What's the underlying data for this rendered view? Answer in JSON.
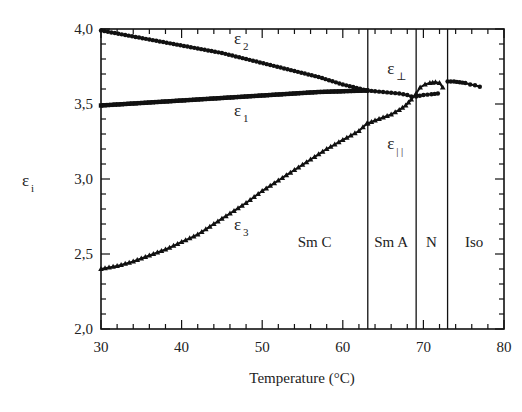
{
  "chart_data": {
    "type": "scatter",
    "title": "",
    "xlabel": "Temperature (°C)",
    "ylabel": "ε_i",
    "xlim": [
      30,
      80
    ],
    "ylim": [
      2.0,
      4.0
    ],
    "x_ticks": [
      "30",
      "40",
      "50",
      "60",
      "70",
      "80"
    ],
    "y_ticks": [
      "2,0",
      "2,5",
      "3,0",
      "3,5",
      "4,0"
    ],
    "grid": false,
    "legend": "none (inline labels)",
    "phase_boundaries": [
      63.1,
      69.1,
      73.0
    ],
    "phase_labels": [
      {
        "label": "Sm C",
        "x": 56.5
      },
      {
        "label": "Sm A",
        "x": 66.0
      },
      {
        "label": "N",
        "x": 71.0
      },
      {
        "label": "Iso",
        "x": 76.3
      }
    ],
    "series": [
      {
        "name": "ε2",
        "marker": "circle",
        "x": [
          30,
          33,
          36,
          39,
          42,
          45,
          48,
          51,
          54,
          57,
          60,
          63
        ],
        "y": [
          3.99,
          3.96,
          3.93,
          3.9,
          3.87,
          3.84,
          3.8,
          3.76,
          3.72,
          3.68,
          3.63,
          3.59
        ]
      },
      {
        "name": "ε1",
        "marker": "square",
        "x": [
          30,
          33,
          36,
          39,
          42,
          45,
          48,
          51,
          54,
          57,
          60,
          63
        ],
        "y": [
          3.49,
          3.5,
          3.51,
          3.52,
          3.53,
          3.54,
          3.55,
          3.56,
          3.57,
          3.58,
          3.585,
          3.59
        ]
      },
      {
        "name": "ε3",
        "marker": "triangle",
        "x": [
          30,
          32,
          34,
          36,
          38,
          40,
          42,
          44,
          46,
          48,
          50,
          52,
          54,
          56,
          58,
          60,
          62,
          63
        ],
        "y": [
          2.4,
          2.42,
          2.45,
          2.49,
          2.53,
          2.58,
          2.63,
          2.7,
          2.77,
          2.84,
          2.92,
          2.99,
          3.06,
          3.13,
          3.2,
          3.26,
          3.32,
          3.37
        ]
      },
      {
        "name": "ε⊥",
        "marker": "circle",
        "x": [
          63.1,
          64,
          65,
          66,
          67,
          68,
          68.5,
          69.1,
          70,
          71,
          71.8
        ],
        "y": [
          3.59,
          3.585,
          3.58,
          3.575,
          3.57,
          3.56,
          3.55,
          3.55,
          3.56,
          3.565,
          3.57
        ]
      },
      {
        "name": "ε∥",
        "marker": "triangle",
        "x": [
          63.1,
          64,
          65,
          66,
          67,
          67.8,
          68.5,
          69.1,
          69.6,
          70.2,
          70.8,
          71.5,
          72.0,
          72.4
        ],
        "y": [
          3.37,
          3.39,
          3.41,
          3.43,
          3.46,
          3.49,
          3.53,
          3.57,
          3.61,
          3.63,
          3.64,
          3.645,
          3.64,
          3.61
        ]
      },
      {
        "name": "ε (Iso)",
        "marker": "circle",
        "x": [
          73.0,
          73.8,
          74.5,
          75.2,
          75.8,
          76.4,
          77.0
        ],
        "y": [
          3.65,
          3.65,
          3.645,
          3.64,
          3.63,
          3.625,
          3.615
        ]
      }
    ],
    "annotations": [
      {
        "text": "ε",
        "sub": "2",
        "x": 46.5,
        "y": 3.9
      },
      {
        "text": "ε",
        "sub": "1",
        "x": 46.5,
        "y": 3.42
      },
      {
        "text": "ε",
        "sub": "3",
        "x": 46.5,
        "y": 2.66
      },
      {
        "text": "ε",
        "sub": "⊥",
        "x": 65.5,
        "y": 3.7
      },
      {
        "text": "ε",
        "sub": "| |",
        "x": 65.5,
        "y": 3.2
      }
    ]
  },
  "labels": {
    "x_axis_title": "Temperature (°C)",
    "y_axis_title_main": "ε",
    "y_axis_title_sub": "i"
  }
}
